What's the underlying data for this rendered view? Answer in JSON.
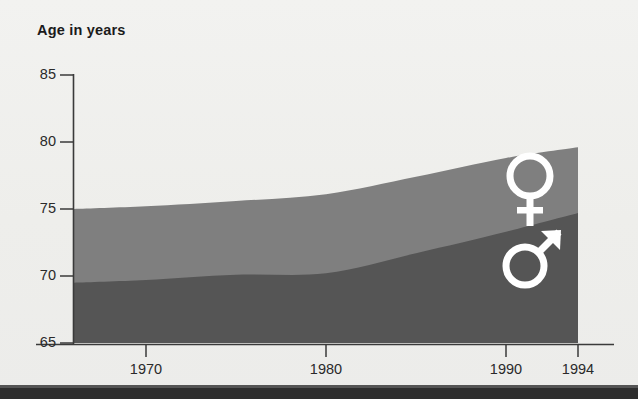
{
  "title": "Age in years",
  "colors": {
    "female_band": "#7f7f7f",
    "male_band": "#555555",
    "axis": "#3a3a3a",
    "background": "#eeeeec",
    "footer_bar": "#2e2e2e",
    "symbol": "#ffffff"
  },
  "axes": {
    "y": {
      "label": "Age in years",
      "min": 65,
      "max": 85,
      "step": 5,
      "ticks": [
        "65",
        "70",
        "75",
        "80",
        "85"
      ]
    },
    "x": {
      "min": 1966,
      "max": 1994,
      "ticks": [
        "1970",
        "1980",
        "1990",
        "1994"
      ]
    }
  },
  "legend": {
    "female_symbol": "venus-symbol",
    "male_symbol": "mars-symbol",
    "female_label": "♀",
    "male_label": "♂"
  },
  "chart_data": {
    "type": "area",
    "title": "Age in years",
    "xlabel": "",
    "ylabel": "Age in years",
    "xlim": [
      1966,
      1994
    ],
    "ylim": [
      65,
      85
    ],
    "grid": false,
    "legend_position": "inside-right",
    "stacked": false,
    "x": [
      1966,
      1970,
      1975,
      1980,
      1985,
      1990,
      1994
    ],
    "series": [
      {
        "name": "♀",
        "symbol": "venus-symbol",
        "color": "#7f7f7f",
        "values": [
          75.0,
          75.2,
          75.6,
          76.1,
          77.4,
          78.8,
          79.6
        ]
      },
      {
        "name": "♂",
        "symbol": "mars-symbol",
        "color": "#555555",
        "values": [
          69.5,
          69.7,
          70.1,
          70.2,
          71.7,
          73.3,
          74.7
        ]
      }
    ],
    "annotations": []
  }
}
